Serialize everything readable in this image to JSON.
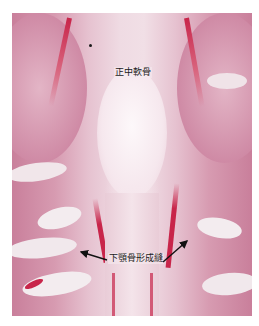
{
  "figure": {
    "type": "histology-micrograph",
    "stain_colors": {
      "background": "#ffffff",
      "tissue_pink": "#d79bb1",
      "tissue_light": "#f5e4ea",
      "cartilage_center": "#fbf3f6",
      "bone_red": "#c8254a",
      "bone_white": "#f3eef0"
    },
    "labels": {
      "median_cartilage": "正中軟骨",
      "mandible_bone_formation": "下顎骨形成縫"
    },
    "arrows": [
      {
        "name": "left-arrow",
        "from": [
          107,
          260
        ],
        "to": [
          80,
          252
        ]
      },
      {
        "name": "right-arrow",
        "from": [
          163,
          262
        ],
        "to": [
          188,
          240
        ]
      }
    ]
  }
}
